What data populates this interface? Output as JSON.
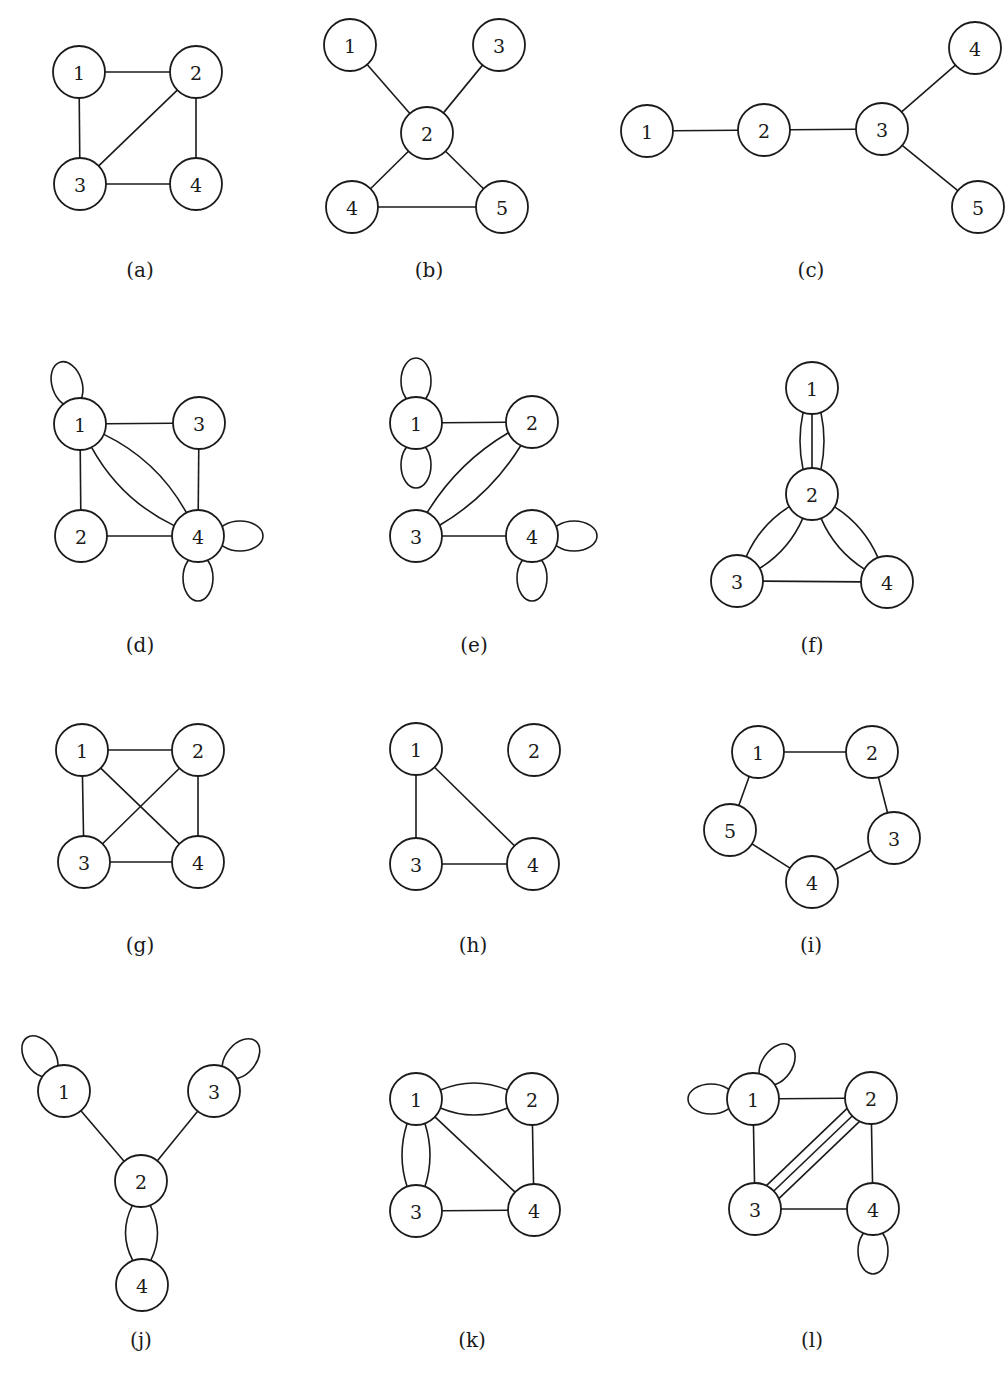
{
  "figure": {
    "node_radius": 26,
    "colors": {
      "stroke": "#1a1a1a",
      "background": "#ffffff",
      "node_fill": "#ffffff"
    },
    "panels": [
      {
        "id": "a",
        "caption": "(a)",
        "caption_pos": [
          140,
          270
        ],
        "nodes": [
          {
            "id": "1",
            "x": 79,
            "y": 72
          },
          {
            "id": "2",
            "x": 196,
            "y": 72
          },
          {
            "id": "3",
            "x": 80,
            "y": 184
          },
          {
            "id": "4",
            "x": 196,
            "y": 184
          }
        ],
        "edges": [
          {
            "from": "1",
            "to": "2"
          },
          {
            "from": "1",
            "to": "3"
          },
          {
            "from": "2",
            "to": "3"
          },
          {
            "from": "2",
            "to": "4"
          },
          {
            "from": "3",
            "to": "4"
          }
        ],
        "loops": []
      },
      {
        "id": "b",
        "caption": "(b)",
        "caption_pos": [
          429,
          270
        ],
        "nodes": [
          {
            "id": "1",
            "x": 350,
            "y": 45
          },
          {
            "id": "2",
            "x": 427,
            "y": 133
          },
          {
            "id": "3",
            "x": 499,
            "y": 45
          },
          {
            "id": "4",
            "x": 352,
            "y": 207
          },
          {
            "id": "5",
            "x": 502,
            "y": 207
          }
        ],
        "edges": [
          {
            "from": "1",
            "to": "2"
          },
          {
            "from": "3",
            "to": "2"
          },
          {
            "from": "2",
            "to": "4"
          },
          {
            "from": "2",
            "to": "5"
          },
          {
            "from": "4",
            "to": "5"
          }
        ],
        "loops": []
      },
      {
        "id": "c",
        "caption": "(c)",
        "caption_pos": [
          811,
          270
        ],
        "nodes": [
          {
            "id": "1",
            "x": 647,
            "y": 131
          },
          {
            "id": "2",
            "x": 764,
            "y": 130
          },
          {
            "id": "3",
            "x": 882,
            "y": 129
          },
          {
            "id": "4",
            "x": 975,
            "y": 48
          },
          {
            "id": "5",
            "x": 978,
            "y": 207
          }
        ],
        "edges": [
          {
            "from": "1",
            "to": "2"
          },
          {
            "from": "2",
            "to": "3"
          },
          {
            "from": "3",
            "to": "4"
          },
          {
            "from": "3",
            "to": "5"
          }
        ],
        "loops": []
      },
      {
        "id": "d",
        "caption": "(d)",
        "caption_pos": [
          140,
          645
        ],
        "nodes": [
          {
            "id": "1",
            "x": 80,
            "y": 424
          },
          {
            "id": "3",
            "x": 199,
            "y": 423
          },
          {
            "id": "2",
            "x": 81,
            "y": 536
          },
          {
            "id": "4",
            "x": 198,
            "y": 536
          }
        ],
        "edges": [
          {
            "from": "1",
            "to": "3"
          },
          {
            "from": "1",
            "to": "2"
          },
          {
            "from": "3",
            "to": "4"
          },
          {
            "from": "2",
            "to": "4"
          },
          {
            "from": "1",
            "to": "4",
            "bend": 18
          },
          {
            "from": "1",
            "to": "4",
            "bend": -18
          }
        ],
        "loops": [
          {
            "node": "1",
            "angle": -108
          },
          {
            "node": "4",
            "angle": 0
          },
          {
            "node": "4",
            "angle": 90
          }
        ]
      },
      {
        "id": "e",
        "caption": "(e)",
        "caption_pos": [
          474,
          645
        ],
        "nodes": [
          {
            "id": "1",
            "x": 416,
            "y": 423
          },
          {
            "id": "2",
            "x": 532,
            "y": 422
          },
          {
            "id": "3",
            "x": 416,
            "y": 536
          },
          {
            "id": "4",
            "x": 532,
            "y": 536
          }
        ],
        "edges": [
          {
            "from": "1",
            "to": "2"
          },
          {
            "from": "3",
            "to": "4"
          },
          {
            "from": "2",
            "to": "3",
            "bend": 16
          },
          {
            "from": "2",
            "to": "3",
            "bend": -16
          }
        ],
        "loops": [
          {
            "node": "1",
            "angle": -90
          },
          {
            "node": "1",
            "angle": 90
          },
          {
            "node": "4",
            "angle": 0
          },
          {
            "node": "4",
            "angle": 90
          }
        ]
      },
      {
        "id": "f",
        "caption": "(f)",
        "caption_pos": [
          812,
          645
        ],
        "nodes": [
          {
            "id": "1",
            "x": 812,
            "y": 388
          },
          {
            "id": "2",
            "x": 812,
            "y": 494
          },
          {
            "id": "3",
            "x": 737,
            "y": 581
          },
          {
            "id": "4",
            "x": 887,
            "y": 582
          }
        ],
        "edges": [
          {
            "from": "1",
            "to": "2",
            "bend": 0
          },
          {
            "from": "1",
            "to": "2",
            "bend": 12
          },
          {
            "from": "1",
            "to": "2",
            "bend": -12
          },
          {
            "from": "2",
            "to": "3",
            "bend": 14
          },
          {
            "from": "2",
            "to": "3",
            "bend": -14
          },
          {
            "from": "2",
            "to": "4",
            "bend": 14
          },
          {
            "from": "2",
            "to": "4",
            "bend": -14
          },
          {
            "from": "3",
            "to": "4"
          }
        ],
        "loops": []
      },
      {
        "id": "g",
        "caption": "(g)",
        "caption_pos": [
          140,
          945
        ],
        "nodes": [
          {
            "id": "1",
            "x": 82,
            "y": 750
          },
          {
            "id": "2",
            "x": 198,
            "y": 750
          },
          {
            "id": "3",
            "x": 84,
            "y": 862
          },
          {
            "id": "4",
            "x": 198,
            "y": 862
          }
        ],
        "edges": [
          {
            "from": "1",
            "to": "2"
          },
          {
            "from": "1",
            "to": "3"
          },
          {
            "from": "1",
            "to": "4"
          },
          {
            "from": "2",
            "to": "3"
          },
          {
            "from": "2",
            "to": "4"
          },
          {
            "from": "3",
            "to": "4"
          }
        ],
        "loops": []
      },
      {
        "id": "h",
        "caption": "(h)",
        "caption_pos": [
          473,
          945
        ],
        "nodes": [
          {
            "id": "1",
            "x": 416,
            "y": 749
          },
          {
            "id": "2",
            "x": 534,
            "y": 750
          },
          {
            "id": "3",
            "x": 416,
            "y": 864
          },
          {
            "id": "4",
            "x": 533,
            "y": 864
          }
        ],
        "edges": [
          {
            "from": "1",
            "to": "3"
          },
          {
            "from": "1",
            "to": "4"
          },
          {
            "from": "3",
            "to": "4"
          }
        ],
        "loops": []
      },
      {
        "id": "i",
        "caption": "(i)",
        "caption_pos": [
          811,
          945
        ],
        "nodes": [
          {
            "id": "1",
            "x": 758,
            "y": 752
          },
          {
            "id": "2",
            "x": 872,
            "y": 752
          },
          {
            "id": "3",
            "x": 894,
            "y": 838
          },
          {
            "id": "4",
            "x": 812,
            "y": 882
          },
          {
            "id": "5",
            "x": 730,
            "y": 830
          }
        ],
        "edges": [
          {
            "from": "1",
            "to": "2"
          },
          {
            "from": "2",
            "to": "3"
          },
          {
            "from": "3",
            "to": "4"
          },
          {
            "from": "4",
            "to": "5"
          },
          {
            "from": "5",
            "to": "1"
          }
        ],
        "loops": []
      },
      {
        "id": "j",
        "caption": "(j)",
        "caption_pos": [
          141,
          1340
        ],
        "nodes": [
          {
            "id": "1",
            "x": 64,
            "y": 1091
          },
          {
            "id": "3",
            "x": 214,
            "y": 1091
          },
          {
            "id": "2",
            "x": 141,
            "y": 1181
          },
          {
            "id": "4",
            "x": 142,
            "y": 1285
          }
        ],
        "edges": [
          {
            "from": "1",
            "to": "2"
          },
          {
            "from": "3",
            "to": "2"
          },
          {
            "from": "2",
            "to": "4",
            "bend": 16
          },
          {
            "from": "2",
            "to": "4",
            "bend": -16
          }
        ],
        "loops": [
          {
            "node": "1",
            "angle": -125
          },
          {
            "node": "3",
            "angle": -50
          }
        ]
      },
      {
        "id": "k",
        "caption": "(k)",
        "caption_pos": [
          472,
          1340
        ],
        "nodes": [
          {
            "id": "1",
            "x": 416,
            "y": 1099
          },
          {
            "id": "2",
            "x": 532,
            "y": 1099
          },
          {
            "id": "3",
            "x": 416,
            "y": 1211
          },
          {
            "id": "4",
            "x": 534,
            "y": 1210
          }
        ],
        "edges": [
          {
            "from": "1",
            "to": "2",
            "bend": 16
          },
          {
            "from": "1",
            "to": "2",
            "bend": -16
          },
          {
            "from": "1",
            "to": "3",
            "bend": 14
          },
          {
            "from": "1",
            "to": "3",
            "bend": -14
          },
          {
            "from": "1",
            "to": "4"
          },
          {
            "from": "2",
            "to": "4"
          },
          {
            "from": "3",
            "to": "4"
          }
        ],
        "loops": []
      },
      {
        "id": "l",
        "caption": "(l)",
        "caption_pos": [
          812,
          1340
        ],
        "nodes": [
          {
            "id": "1",
            "x": 753,
            "y": 1099
          },
          {
            "id": "2",
            "x": 871,
            "y": 1098
          },
          {
            "id": "3",
            "x": 755,
            "y": 1209
          },
          {
            "id": "4",
            "x": 873,
            "y": 1209
          }
        ],
        "edges": [
          {
            "from": "1",
            "to": "2"
          },
          {
            "from": "1",
            "to": "3"
          },
          {
            "from": "2",
            "to": "4"
          },
          {
            "from": "3",
            "to": "4"
          },
          {
            "from": "2",
            "to": "3",
            "offset": 0
          },
          {
            "from": "2",
            "to": "3",
            "offset": 9
          },
          {
            "from": "2",
            "to": "3",
            "offset": -9
          }
        ],
        "loops": [
          {
            "node": "1",
            "angle": 180
          },
          {
            "node": "1",
            "angle": -55
          },
          {
            "node": "4",
            "angle": 90
          }
        ]
      }
    ]
  }
}
